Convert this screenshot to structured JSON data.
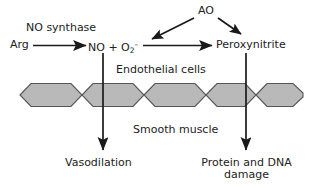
{
  "diagram": {
    "colors": {
      "cell_fill": "#b9b9b9",
      "cell_stroke": "#555555",
      "line": "#1a1a1a",
      "text": "#222222",
      "background": "#ffffff"
    },
    "nodes": {
      "arg": "Arg",
      "no_synthase": "NO synthase",
      "no_plus": "NO + O",
      "no_plus_sub": "2",
      "no_plus_sup": "–",
      "ao": "AO",
      "peroxynitrite": "Peroxynitrite",
      "endothelial_cells": "Endothelial cells",
      "smooth_muscle": "Smooth muscle",
      "vasodilation": "Vasodilation",
      "protein_dna_damage": "Protein and DNA damage"
    },
    "arrows": [
      {
        "name": "arg-to-no",
        "from": "Arg",
        "to": "NO + O2-",
        "label": "NO synthase",
        "direction": "right"
      },
      {
        "name": "no-to-peroxynitrite",
        "from": "NO + O2-",
        "to": "Peroxynitrite",
        "label": "",
        "direction": "right"
      },
      {
        "name": "ao-to-no",
        "from": "AO",
        "to": "NO + O2-",
        "label": "",
        "direction": "down-left"
      },
      {
        "name": "ao-to-peroxynitrite",
        "from": "AO",
        "to": "Peroxynitrite",
        "label": "",
        "direction": "down-right"
      },
      {
        "name": "no-to-vasodilation",
        "from": "NO + O2-",
        "to": "Vasodilation",
        "label": "",
        "direction": "down"
      },
      {
        "name": "peroxynitrite-to-damage",
        "from": "Peroxynitrite",
        "to": "Protein and DNA damage",
        "label": "",
        "direction": "down"
      }
    ],
    "cell_count": 5
  }
}
